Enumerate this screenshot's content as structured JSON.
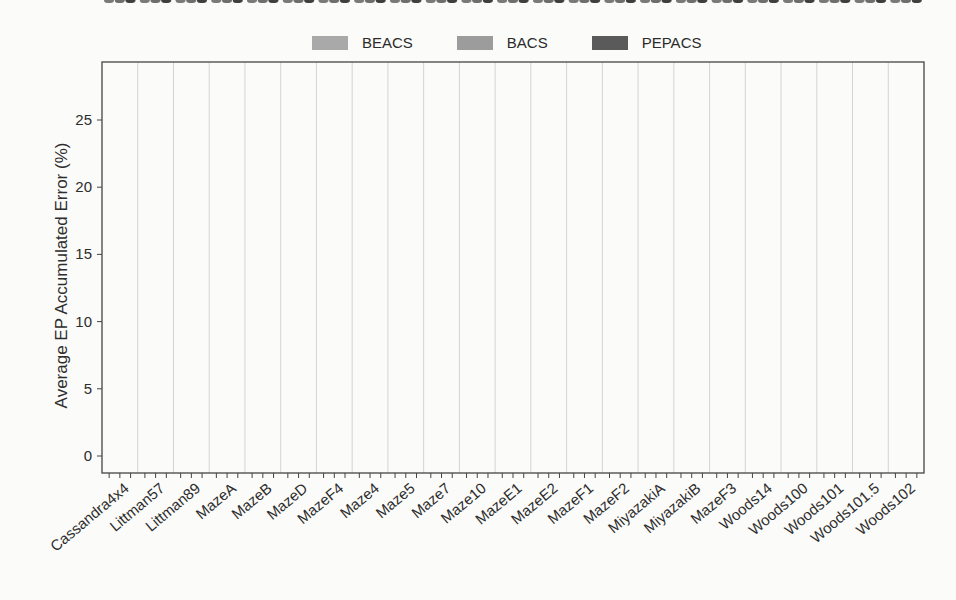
{
  "chart_data": {
    "type": "box",
    "title": "",
    "xlabel": "",
    "ylabel": "Average EP Accumulated Error (%)",
    "ylim": [
      -0.8,
      29.5
    ],
    "yticks": [
      0,
      5,
      10,
      15,
      20,
      25
    ],
    "grid": "vertical separators between categories",
    "legend": {
      "placement": "top-center",
      "entries": [
        {
          "name": "BEACS",
          "color": "#a9a9a9"
        },
        {
          "name": "BACS",
          "color": "#9c9c9c"
        },
        {
          "name": "PEPACS",
          "color": "#5a5a5a"
        }
      ]
    },
    "categories": [
      "Cassandra4x4",
      "Littman57",
      "Littman89",
      "MazeA",
      "MazeB",
      "MazeD",
      "MazeF4",
      "Maze4",
      "Maze5",
      "Maze7",
      "Maze10",
      "MazeE1",
      "MazeE2",
      "MazeF1",
      "MazeF2",
      "MiyazakiA",
      "MiyazakiB",
      "MazeF3",
      "Woods14",
      "Woods100",
      "Woods101",
      "Woods101.5",
      "Woods102"
    ],
    "series": [
      {
        "name": "BEACS",
        "median": [
          4.6,
          2.7,
          3.8,
          1.3,
          4.0,
          3.4,
          1.1,
          1.6,
          1.6,
          1.0,
          2.5,
          5.1,
          3.6,
          0.9,
          0.7,
          4.8,
          4.3,
          0.5,
          0.1,
          0.1,
          2.6,
          3.3,
          3.8
        ],
        "q1": [
          4.3,
          2.4,
          3.5,
          1.2,
          3.8,
          3.2,
          1.0,
          1.5,
          1.5,
          0.9,
          2.0,
          4.8,
          3.2,
          0.8,
          0.6,
          4.5,
          3.9,
          0.4,
          0.05,
          0.05,
          2.3,
          3.0,
          3.6
        ],
        "q3": [
          4.9,
          3.0,
          4.1,
          1.4,
          4.2,
          3.6,
          1.2,
          1.7,
          1.7,
          1.1,
          3.0,
          5.4,
          4.0,
          1.0,
          0.8,
          5.1,
          4.6,
          0.6,
          0.15,
          0.15,
          3.0,
          3.6,
          4.1
        ],
        "min": [
          3.9,
          2.0,
          3.2,
          1.1,
          3.5,
          3.0,
          0.8,
          1.4,
          1.4,
          0.7,
          1.5,
          4.3,
          2.8,
          0.7,
          0.5,
          4.2,
          3.4,
          0.3,
          0.0,
          0.0,
          2.0,
          2.6,
          3.3
        ],
        "max": [
          5.5,
          3.6,
          5.3,
          1.5,
          4.5,
          3.9,
          1.4,
          1.9,
          1.9,
          1.7,
          5.0,
          5.9,
          5.5,
          1.2,
          0.9,
          5.8,
          5.4,
          0.7,
          0.3,
          0.3,
          3.6,
          4.1,
          5.2
        ]
      },
      {
        "name": "BACS",
        "median": [
          19.7,
          13.6,
          20.4,
          18.9,
          20.1,
          19.0,
          12.0,
          18.0,
          18.7,
          9.3,
          12.4,
          18.6,
          11.4,
          15.2,
          14.9,
          18.4,
          17.1,
          12.5,
          7.1,
          2.2,
          15.8,
          8.1,
          16.1
        ],
        "q1": [
          19.4,
          13.5,
          19.7,
          18.6,
          19.8,
          18.8,
          11.1,
          17.8,
          18.4,
          9.2,
          12.0,
          18.4,
          11.2,
          14.9,
          14.8,
          18.2,
          16.9,
          12.2,
          6.9,
          2.1,
          14.5,
          7.9,
          15.7
        ],
        "q3": [
          20.0,
          13.7,
          21.0,
          19.2,
          20.4,
          19.3,
          12.7,
          18.2,
          19.0,
          9.4,
          12.9,
          18.8,
          11.7,
          15.7,
          15.0,
          18.6,
          17.4,
          12.8,
          7.4,
          2.3,
          17.1,
          8.4,
          16.4
        ],
        "min": [
          19.0,
          13.4,
          19.4,
          18.4,
          19.5,
          18.6,
          10.9,
          17.7,
          18.2,
          9.1,
          11.6,
          18.2,
          10.9,
          14.8,
          14.7,
          18.0,
          16.7,
          12.0,
          6.7,
          2.0,
          14.3,
          7.6,
          15.5
        ],
        "max": [
          21.1,
          17.4,
          23.7,
          20.0,
          21.6,
          19.9,
          15.0,
          18.5,
          19.5,
          14.2,
          15.8,
          19.3,
          12.4,
          21.9,
          19.7,
          19.4,
          18.0,
          14.6,
          7.8,
          2.8,
          19.1,
          8.6,
          17.8
        ]
      },
      {
        "name": "PEPACS",
        "median": [
          19.2,
          21.6,
          27.0,
          27.0,
          25.9,
          25.9,
          18.5,
          24.5,
          26.8,
          16.2,
          19.6,
          18.5,
          14.1,
          25.4,
          24.6,
          21.0,
          20.5,
          20.4,
          14.9,
          3.4,
          22.3,
          12.6,
          23.4
        ],
        "q1": [
          18.8,
          21.1,
          26.6,
          26.7,
          25.6,
          25.5,
          18.0,
          24.1,
          26.4,
          15.7,
          19.3,
          18.1,
          13.8,
          25.0,
          24.2,
          20.7,
          20.2,
          20.1,
          14.6,
          3.3,
          21.8,
          12.2,
          23.0
        ],
        "q3": [
          19.5,
          22.0,
          27.3,
          27.2,
          26.2,
          26.3,
          19.0,
          24.9,
          27.1,
          16.6,
          20.0,
          18.8,
          14.4,
          25.8,
          25.0,
          21.3,
          20.8,
          20.7,
          15.2,
          3.5,
          22.7,
          13.0,
          23.8
        ],
        "min": [
          18.3,
          20.2,
          26.2,
          26.1,
          25.2,
          24.5,
          17.2,
          23.8,
          25.4,
          15.3,
          18.8,
          16.6,
          13.4,
          24.2,
          23.4,
          20.0,
          19.8,
          19.5,
          14.2,
          3.2,
          20.8,
          10.5,
          21.7
        ],
        "max": [
          20.2,
          23.5,
          28.0,
          27.6,
          26.7,
          27.5,
          20.7,
          25.5,
          27.8,
          17.2,
          21.0,
          19.6,
          14.9,
          26.7,
          26.3,
          22.0,
          21.6,
          21.3,
          15.7,
          3.6,
          24.7,
          14.7,
          24.7
        ]
      }
    ]
  }
}
